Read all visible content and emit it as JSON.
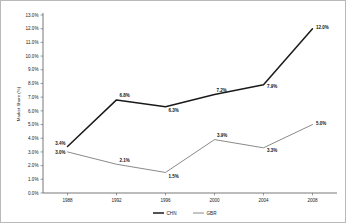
{
  "chart_data": {
    "type": "line",
    "title": "",
    "xlabel": "",
    "ylabel": "Market Share (%)",
    "x": [
      "1988",
      "1992",
      "1996",
      "2000",
      "2004",
      "2008"
    ],
    "categories": [
      "1988",
      "1992",
      "1996",
      "2000",
      "2004",
      "2008"
    ],
    "series": [
      {
        "name": "CHN",
        "values": [
          3.4,
          6.8,
          6.3,
          7.2,
          7.9,
          12.0
        ],
        "labels": [
          "3.4%",
          "6.8%",
          "6.3%",
          "7.2%",
          "7.9%",
          "12.0%"
        ],
        "color": "#1a1a1a"
      },
      {
        "name": "GBR",
        "values": [
          3.0,
          2.1,
          1.5,
          3.9,
          3.3,
          5.0
        ],
        "labels": [
          "3.0%",
          "2.1%",
          "1.5%",
          "3.9%",
          "3.3%",
          "5.0%"
        ],
        "color": "#8a8a8a"
      }
    ],
    "ylim": [
      0.0,
      13.0
    ],
    "ytick_values": [
      0.0,
      1.0,
      2.0,
      3.0,
      4.0,
      5.0,
      6.0,
      7.0,
      8.0,
      9.0,
      10.0,
      11.0,
      12.0,
      13.0
    ],
    "ytick_labels": [
      "0.0%",
      "1.0%",
      "2.0%",
      "3.0%",
      "4.0%",
      "5.0%",
      "6.0%",
      "7.0%",
      "8.0%",
      "9.0%",
      "10.0%",
      "11.0%",
      "12.0%",
      "13.0%"
    ],
    "xtick_labels": [
      "1988",
      "1992",
      "1996",
      "2000",
      "2004",
      "2008"
    ],
    "grid": false,
    "legend_position": "bottom-center",
    "legend_entries": [
      "CHN",
      "GBR"
    ]
  }
}
